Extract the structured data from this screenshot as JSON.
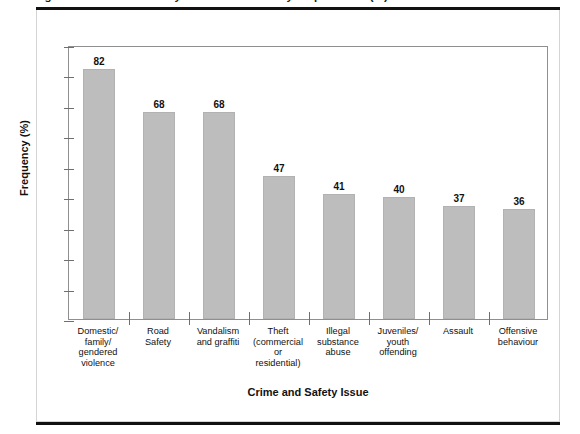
{
  "figure": {
    "caption_clipped": "Figure 1: Crime and safety issues identified by respondents (%)",
    "x_axis_title": "Crime and Safety Issue",
    "y_axis_title": "Frequency (%)"
  },
  "chart_data": {
    "type": "bar",
    "title": "",
    "xlabel": "Crime and Safety Issue",
    "ylabel": "Frequency (%)",
    "ylim": [
      0,
      90
    ],
    "ytick_step": 10,
    "yticks": [
      "0",
      "10",
      "20",
      "30",
      "40",
      "50",
      "60",
      "70",
      "80",
      "90"
    ],
    "grid": "off",
    "legend": "none",
    "bar_color": "#bdbdbd",
    "categories": [
      "Domestic/ family/ gendered violence",
      "Road Safety",
      "Vandalism and graffiti",
      "Theft (commercial or residential)",
      "Illegal substance abuse",
      "Juveniles/ youth offending",
      "Assault",
      "Offensive behaviour"
    ],
    "category_lines": [
      [
        "Domestic/",
        "family/",
        "gendered",
        "violence"
      ],
      [
        "Road",
        "Safety"
      ],
      [
        "Vandalism",
        "and graffiti"
      ],
      [
        "Theft",
        "(commercial",
        "or",
        "residential)"
      ],
      [
        "Illegal",
        "substance",
        "abuse"
      ],
      [
        "Juveniles/",
        "youth",
        "offending"
      ],
      [
        "Assault"
      ],
      [
        "Offensive",
        "behaviour"
      ]
    ],
    "values": [
      82,
      68,
      68,
      47,
      41,
      40,
      37,
      36
    ],
    "value_labels": [
      "82",
      "68",
      "68",
      "47",
      "41",
      "40",
      "37",
      "36"
    ]
  }
}
